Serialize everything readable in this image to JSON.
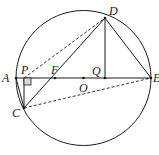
{
  "diagram": {
    "stroke_color": "#1a1a1a",
    "circle": {
      "center": "O",
      "cx": 83.5,
      "cy": 78,
      "r": 67.5
    },
    "points": {
      "A": {
        "label": "A",
        "x": 16,
        "y": 78
      },
      "E": {
        "label": "E",
        "x": 151,
        "y": 78
      },
      "O": {
        "label": "O",
        "x": 83.5,
        "y": 78
      },
      "D": {
        "label": "D",
        "x": 105,
        "y": 18
      },
      "Q": {
        "label": "Q",
        "x": 105,
        "y": 78
      },
      "F": {
        "label": "F",
        "x": 55,
        "y": 78
      },
      "P": {
        "label": "P",
        "x": 24,
        "y": 78
      },
      "C": {
        "label": "C",
        "x": 24,
        "y": 108
      }
    },
    "solid_segments": [
      "AE",
      "DQ",
      "DE",
      "DC",
      "AC",
      "PC"
    ],
    "dashed_segments": [
      "PD",
      "CE"
    ],
    "right_angle_marker": "P"
  }
}
